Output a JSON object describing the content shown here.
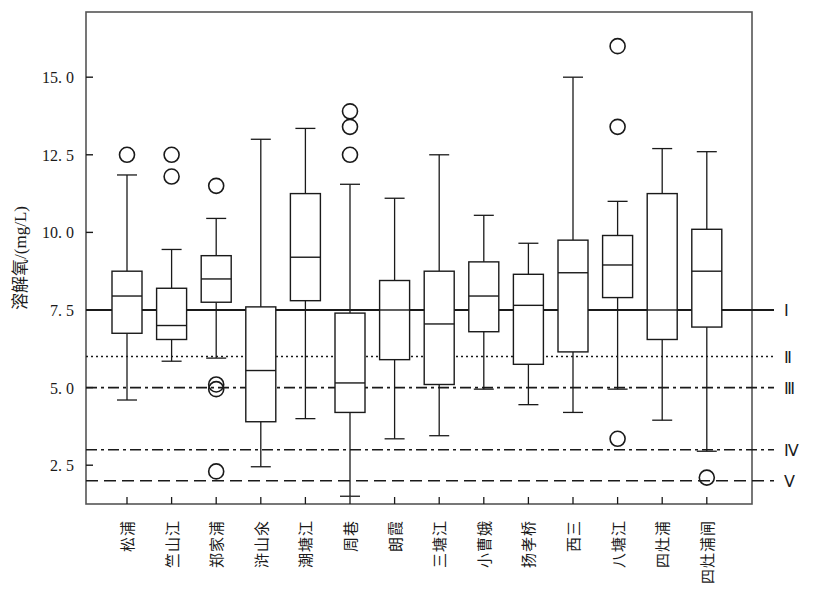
{
  "chart_data": {
    "type": "box",
    "title": "",
    "xlabel": "",
    "ylabel": "溶解氧/(mg/L)",
    "ylim": [
      1.25,
      17.1
    ],
    "yticks": [
      2.5,
      5.0,
      7.5,
      10.0,
      12.5,
      15.0
    ],
    "ytick_labels": [
      "2. 5",
      "5. 0",
      "7. 5",
      "10. 0",
      "12. 5",
      "15. 0"
    ],
    "grid": false,
    "legend_position": "right-outside",
    "categories": [
      "松浦",
      "竺山江",
      "郑家浦",
      "浒山氽",
      "潮塘江",
      "周巷",
      "朗霞",
      "三塘江",
      "小曹娥",
      "扬孝桥",
      "西三",
      "八塘江",
      "四灶浦",
      "四灶浦闸"
    ],
    "boxes": [
      {
        "category": "松浦",
        "whisker_low": 4.6,
        "q1": 6.75,
        "median": 7.95,
        "q3": 8.75,
        "whisker_high": 11.85,
        "outliers": [
          12.5
        ]
      },
      {
        "category": "竺山江",
        "whisker_low": 5.85,
        "q1": 6.55,
        "median": 7.0,
        "q3": 8.2,
        "whisker_high": 9.45,
        "outliers": [
          12.5,
          11.8
        ]
      },
      {
        "category": "郑家浦",
        "whisker_low": 5.95,
        "q1": 7.75,
        "median": 8.5,
        "q3": 9.25,
        "whisker_high": 10.45,
        "outliers": [
          11.5,
          5.1,
          4.95,
          2.3
        ]
      },
      {
        "category": "浒山氽",
        "whisker_low": 2.45,
        "q1": 3.9,
        "median": 5.55,
        "q3": 7.6,
        "whisker_high": 13.0,
        "outliers": []
      },
      {
        "category": "潮塘江",
        "whisker_low": 4.0,
        "q1": 7.8,
        "median": 9.2,
        "q3": 11.25,
        "whisker_high": 13.35,
        "outliers": []
      },
      {
        "category": "周巷",
        "whisker_low": 1.5,
        "q1": 4.2,
        "median": 5.15,
        "q3": 7.4,
        "whisker_high": 11.55,
        "outliers": [
          13.9,
          13.4,
          12.5
        ]
      },
      {
        "category": "朗霞",
        "whisker_low": 3.35,
        "q1": 5.9,
        "median": 7.5,
        "q3": 8.45,
        "whisker_high": 11.1,
        "outliers": []
      },
      {
        "category": "三塘江",
        "whisker_low": 3.45,
        "q1": 5.1,
        "median": 7.05,
        "q3": 8.75,
        "whisker_high": 12.5,
        "outliers": []
      },
      {
        "category": "小曹娥",
        "whisker_low": 4.95,
        "q1": 6.8,
        "median": 7.95,
        "q3": 9.05,
        "whisker_high": 10.55,
        "outliers": []
      },
      {
        "category": "扬孝桥",
        "whisker_low": 4.45,
        "q1": 5.75,
        "median": 7.65,
        "q3": 8.65,
        "whisker_high": 9.65,
        "outliers": []
      },
      {
        "category": "西三",
        "whisker_low": 4.2,
        "q1": 6.15,
        "median": 8.7,
        "q3": 9.75,
        "whisker_high": 15.0,
        "outliers": []
      },
      {
        "category": "八塘江",
        "whisker_low": 4.95,
        "q1": 7.9,
        "median": 8.95,
        "q3": 9.9,
        "whisker_high": 11.0,
        "outliers": [
          16.0,
          13.4,
          3.35
        ]
      },
      {
        "category": "四灶浦",
        "whisker_low": 3.95,
        "q1": 6.55,
        "median": 7.5,
        "q3": 11.25,
        "whisker_high": 12.7,
        "outliers": []
      },
      {
        "category": "四灶浦闸",
        "whisker_low": 2.95,
        "q1": 6.95,
        "median": 8.75,
        "q3": 10.1,
        "whisker_high": 12.6,
        "outliers": [
          2.1
        ]
      }
    ],
    "reference_lines": [
      {
        "label": "Ⅰ",
        "value": 7.5,
        "style": "solid"
      },
      {
        "label": "Ⅱ",
        "value": 6.0,
        "style": "dotted"
      },
      {
        "label": "Ⅲ",
        "value": 5.0,
        "style": "dashdot"
      },
      {
        "label": "Ⅳ",
        "value": 3.0,
        "style": "dashdot"
      },
      {
        "label": "Ⅴ",
        "value": 2.0,
        "style": "dashed"
      }
    ],
    "colors": {
      "line": "#1a1a1a",
      "box_fill": "#ffffff",
      "frame": "#555555",
      "background": "#ffffff"
    }
  }
}
